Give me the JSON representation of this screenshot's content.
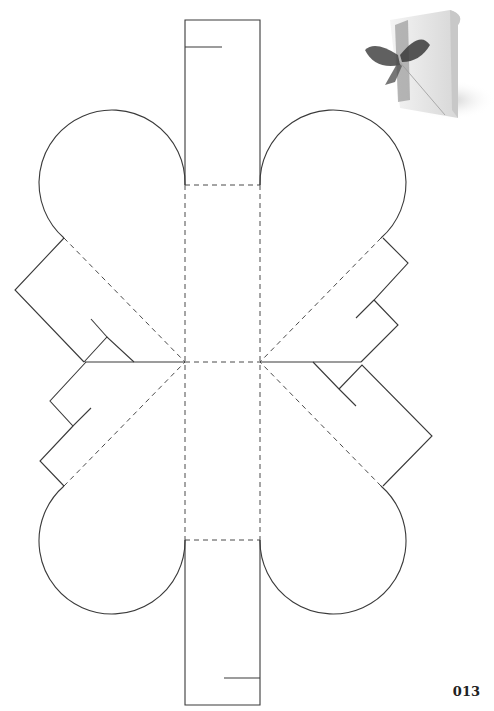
{
  "diagram": {
    "type": "heart-box papercraft template",
    "legend": {
      "cut_line": "solid",
      "fold_line": "dashed"
    },
    "colors": {
      "line": "#3a3a3a",
      "background": "#ffffff"
    },
    "parts": [
      "top-strip",
      "bottom-strip",
      "center-panel",
      "heart-lobe-top-left",
      "heart-lobe-top-right",
      "heart-lobe-bottom-left",
      "heart-lobe-bottom-right",
      "glue-tab-left-upper",
      "glue-tab-left-lower",
      "glue-tab-right-upper",
      "glue-tab-right-lower"
    ]
  },
  "photo": {
    "subject": "white heart-shaped gift box with dark ribbon bow"
  },
  "page": {
    "number": "013"
  }
}
